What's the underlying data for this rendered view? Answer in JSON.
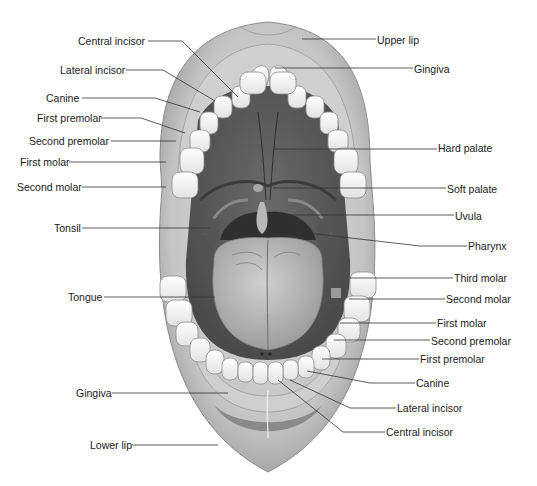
{
  "diagram": {
    "colors": {
      "background": "#ffffff",
      "lip": "#b9b9b9",
      "lip_highlight": "#d8d8d8",
      "gingiva": "#c8c8c8",
      "tooth": "#f2f2f2",
      "tooth_outline": "#8a8a8a",
      "palate": "#5e5e5e",
      "throat": "#3a3a3a",
      "tongue": "#b0b0b0",
      "leader_line": "#333333",
      "text": "#1a1a1a"
    },
    "labels_left": [
      {
        "id": "central-incisor-upper",
        "text": "Central incisor",
        "x": 78,
        "y": 35
      },
      {
        "id": "lateral-incisor-upper",
        "text": "Lateral incisor",
        "x": 60,
        "y": 64
      },
      {
        "id": "canine-upper",
        "text": "Canine",
        "x": 46,
        "y": 92
      },
      {
        "id": "first-premolar-upper",
        "text": "First premolar",
        "x": 37,
        "y": 112
      },
      {
        "id": "second-premolar-upper",
        "text": "Second premolar",
        "x": 29,
        "y": 135
      },
      {
        "id": "first-molar-upper",
        "text": "First molar",
        "x": 20,
        "y": 156
      },
      {
        "id": "second-molar-upper",
        "text": "Second molar",
        "x": 17,
        "y": 181
      },
      {
        "id": "tonsil",
        "text": "Tonsil",
        "x": 54,
        "y": 222
      },
      {
        "id": "tongue",
        "text": "Tongue",
        "x": 68,
        "y": 291
      },
      {
        "id": "gingiva-lower",
        "text": "Gingiva",
        "x": 76,
        "y": 387
      },
      {
        "id": "lower-lip",
        "text": "Lower lip",
        "x": 90,
        "y": 439
      }
    ],
    "labels_right": [
      {
        "id": "upper-lip",
        "text": "Upper lip",
        "x": 377,
        "y": 34
      },
      {
        "id": "gingiva-upper",
        "text": "Gingiva",
        "x": 414,
        "y": 63
      },
      {
        "id": "hard-palate",
        "text": "Hard palate",
        "x": 438,
        "y": 142
      },
      {
        "id": "soft-palate",
        "text": "Soft palate",
        "x": 447,
        "y": 183
      },
      {
        "id": "uvula",
        "text": "Uvula",
        "x": 455,
        "y": 210
      },
      {
        "id": "pharynx",
        "text": "Pharynx",
        "x": 468,
        "y": 240
      },
      {
        "id": "third-molar",
        "text": "Third molar",
        "x": 454,
        "y": 272
      },
      {
        "id": "second-molar-lower",
        "text": "Second molar",
        "x": 446,
        "y": 293
      },
      {
        "id": "first-molar-lower",
        "text": "First molar",
        "x": 437,
        "y": 317
      },
      {
        "id": "second-premolar-lower",
        "text": "Second premolar",
        "x": 431,
        "y": 335
      },
      {
        "id": "first-premolar-lower",
        "text": "First premolar",
        "x": 420,
        "y": 353
      },
      {
        "id": "canine-lower",
        "text": "Canine",
        "x": 416,
        "y": 377
      },
      {
        "id": "lateral-incisor-lower",
        "text": "Lateral incisor",
        "x": 397,
        "y": 402
      },
      {
        "id": "central-incisor-lower",
        "text": "Central incisor",
        "x": 386,
        "y": 426
      }
    ]
  }
}
